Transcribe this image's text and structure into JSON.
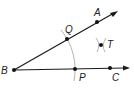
{
  "diagram": {
    "colors": {
      "line": "#1a1a1a",
      "arc": "#aaaaaa",
      "point": "#111111",
      "label": "#222222"
    },
    "labels": {
      "B": "B",
      "A": "A",
      "Q": "Q",
      "T": "T",
      "P": "P",
      "C": "C"
    },
    "points": [
      {
        "name": "B",
        "x": 14,
        "y": 70
      },
      {
        "name": "Q",
        "x": 67,
        "y": 39
      },
      {
        "name": "A",
        "x": 97,
        "y": 22
      },
      {
        "name": "P",
        "x": 75,
        "y": 69
      },
      {
        "name": "C",
        "x": 110,
        "y": 68
      },
      {
        "name": "T",
        "x": 101,
        "y": 45
      }
    ],
    "rays": [
      {
        "from": "B",
        "through": "A",
        "label": "ray BA"
      },
      {
        "from": "B",
        "through": "C",
        "label": "ray BC"
      }
    ]
  }
}
